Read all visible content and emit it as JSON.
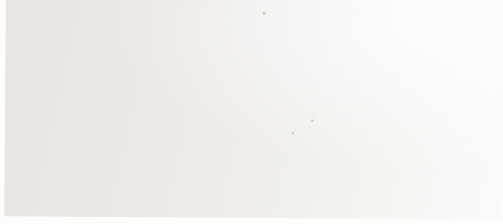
{
  "figure": {
    "ylabel": "adult obesity prevalence in England/%",
    "xlabel": "year"
  },
  "chart_data": {
    "type": "line",
    "title": "",
    "xlabel": "year",
    "ylabel": "adult obesity prevalence in England/%",
    "x": [
      1993,
      1994,
      1995,
      1996,
      1997,
      1998,
      1999,
      2000,
      2001,
      2002,
      2003,
      2004,
      2005
    ],
    "y_ticks": [
      0,
      5,
      10,
      15,
      20,
      25,
      30
    ],
    "ylim": [
      0,
      30
    ],
    "grid": true,
    "legend": "inline-labels",
    "series": [
      {
        "name": "women",
        "marker": "square",
        "color": "#4e4d4c",
        "values": [
          16.5,
          17.3,
          17.6,
          18.3,
          19.4,
          21.0,
          20.8,
          21.2,
          23.3,
          22.4,
          22.8,
          23.2,
          24.2
        ]
      },
      {
        "name": "men",
        "marker": "circle",
        "color": "#474645",
        "values": [
          13.0,
          13.9,
          15.3,
          16.0,
          16.8,
          17.2,
          18.6,
          21.0,
          20.8,
          21.6,
          22.3,
          23.2,
          22.4
        ]
      }
    ],
    "annotations": [
      {
        "text": "women",
        "x": 1997.4,
        "y": 21.9
      },
      {
        "text": "men",
        "x": 1998.5,
        "y": 15.1
      }
    ]
  },
  "colors": {
    "axis": "#1c1c1c",
    "grid": "#c6c5c2",
    "tick_text": "#1c1c1c",
    "annotation_text": "#2b2b2b"
  }
}
